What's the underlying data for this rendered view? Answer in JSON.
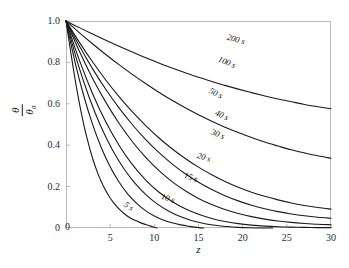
{
  "chart_data": {
    "type": "line",
    "title": "",
    "xlabel": "z",
    "ylabel": "theta/theta_0",
    "xlim": [
      0,
      30
    ],
    "ylim": [
      0,
      1.0
    ],
    "grid": false,
    "legend_position": "inline-curve-labels",
    "xticks": [
      0,
      5,
      10,
      15,
      20,
      25,
      30
    ],
    "xticklabels": [
      "0",
      "5",
      "10",
      "15",
      "20",
      "25",
      "30"
    ],
    "yticks": [
      0,
      0.2,
      0.4,
      0.6,
      0.8,
      1.0
    ],
    "yticklabels": [
      "0",
      "0.2",
      "0.4",
      "0.6",
      "0.8",
      "1.0"
    ],
    "series": [
      {
        "name": "5 s",
        "label": "5 s",
        "label_x": 7.1,
        "label_y": 0.105,
        "x": [
          0,
          0.6,
          1.2,
          1.8,
          2.4,
          3.0,
          3.6,
          4.2,
          4.8,
          5.4,
          6.0,
          6.6,
          7.2,
          7.8,
          8.4,
          9.0,
          9.6,
          10.3
        ],
        "y": [
          1.0,
          0.832,
          0.676,
          0.542,
          0.43,
          0.338,
          0.264,
          0.205,
          0.158,
          0.121,
          0.092,
          0.069,
          0.051,
          0.037,
          0.026,
          0.017,
          0.009,
          0.0
        ]
      },
      {
        "name": "10 s",
        "label": "10 s",
        "label_x": 11.6,
        "label_y": 0.145,
        "x": [
          0,
          1,
          2,
          3,
          4,
          5,
          6,
          7,
          8,
          9,
          10,
          11,
          12,
          13,
          14,
          15,
          15.6
        ],
        "y": [
          1.0,
          0.805,
          0.64,
          0.502,
          0.388,
          0.296,
          0.222,
          0.164,
          0.119,
          0.084,
          0.058,
          0.039,
          0.025,
          0.015,
          0.008,
          0.002,
          0.0
        ]
      },
      {
        "name": "15 s",
        "label": "15 s",
        "label_x": 14.2,
        "label_y": 0.245,
        "x": [
          0,
          1.3,
          2.6,
          3.9,
          5.2,
          6.5,
          7.8,
          9.1,
          10.4,
          11.7,
          13.0,
          14.3,
          15.6,
          16.9,
          18.2,
          19.5,
          20.8,
          22.1,
          23.4
        ],
        "y": [
          1.0,
          0.8,
          0.634,
          0.495,
          0.382,
          0.29,
          0.217,
          0.159,
          0.114,
          0.08,
          0.054,
          0.035,
          0.022,
          0.013,
          0.007,
          0.003,
          0.001,
          0.0,
          0.0
        ]
      },
      {
        "name": "20 s",
        "label": "20 s",
        "label_x": 15.6,
        "label_y": 0.345,
        "x": [
          0,
          1.5,
          3,
          4.5,
          6,
          7.5,
          9,
          10.5,
          12,
          13.5,
          15,
          16.5,
          18,
          19.5,
          21,
          22.5,
          24,
          25.5,
          27,
          28.5,
          30
        ],
        "y": [
          1.0,
          0.812,
          0.65,
          0.513,
          0.4,
          0.307,
          0.233,
          0.174,
          0.128,
          0.093,
          0.066,
          0.046,
          0.031,
          0.021,
          0.014,
          0.009,
          0.006,
          0.004,
          0.003,
          0.002,
          0.002
        ]
      },
      {
        "name": "30 s",
        "label": "30 s",
        "label_x": 17.2,
        "label_y": 0.455,
        "x": [
          0,
          1.5,
          3,
          4.5,
          6,
          7.5,
          9,
          10.5,
          12,
          13.5,
          15,
          16.5,
          18,
          19.5,
          21,
          22.5,
          24,
          25.5,
          27,
          28.5,
          30
        ],
        "y": [
          1.0,
          0.855,
          0.724,
          0.608,
          0.506,
          0.418,
          0.342,
          0.278,
          0.224,
          0.18,
          0.143,
          0.113,
          0.089,
          0.07,
          0.055,
          0.043,
          0.034,
          0.027,
          0.022,
          0.018,
          0.016
        ]
      },
      {
        "name": "40 s",
        "label": "40 s",
        "label_x": 17.7,
        "label_y": 0.545,
        "x": [
          0,
          1.5,
          3,
          4.5,
          6,
          7.5,
          9,
          10.5,
          12,
          13.5,
          15,
          16.5,
          18,
          19.5,
          21,
          22.5,
          24,
          25.5,
          27,
          28.5,
          30
        ],
        "y": [
          1.0,
          0.88,
          0.77,
          0.67,
          0.58,
          0.5,
          0.428,
          0.365,
          0.31,
          0.262,
          0.221,
          0.186,
          0.156,
          0.131,
          0.11,
          0.093,
          0.079,
          0.068,
          0.059,
          0.052,
          0.047
        ]
      },
      {
        "name": "50 s",
        "label": "50 s",
        "label_x": 17.0,
        "label_y": 0.65,
        "x": [
          0,
          1.5,
          3,
          4.5,
          6,
          7.5,
          9,
          10.5,
          12,
          13.5,
          15,
          16.5,
          18,
          19.5,
          21,
          22.5,
          24,
          25.5,
          27,
          28.5,
          30
        ],
        "y": [
          1.0,
          0.898,
          0.803,
          0.715,
          0.635,
          0.562,
          0.496,
          0.436,
          0.383,
          0.336,
          0.294,
          0.257,
          0.225,
          0.197,
          0.173,
          0.153,
          0.136,
          0.121,
          0.109,
          0.099,
          0.091
        ]
      },
      {
        "name": "100 s",
        "label": "100 s",
        "label_x": 18.2,
        "label_y": 0.8,
        "x": [
          0,
          1.5,
          3,
          4.5,
          6,
          7.5,
          9,
          10.5,
          12,
          13.5,
          15,
          16.5,
          18,
          19.5,
          21,
          22.5,
          24,
          25.5,
          27,
          28.5,
          30
        ],
        "y": [
          1.0,
          0.944,
          0.89,
          0.838,
          0.789,
          0.742,
          0.698,
          0.656,
          0.617,
          0.581,
          0.547,
          0.516,
          0.487,
          0.461,
          0.437,
          0.415,
          0.396,
          0.378,
          0.363,
          0.349,
          0.337
        ]
      },
      {
        "name": "200 s",
        "label": "200 s",
        "label_x": 19.3,
        "label_y": 0.915,
        "x": [
          0,
          1.5,
          3,
          4.5,
          6,
          7.5,
          9,
          10.5,
          12,
          13.5,
          15,
          16.5,
          18,
          19.5,
          21,
          22.5,
          24,
          25.5,
          27,
          28.5,
          30
        ],
        "y": [
          1.0,
          0.968,
          0.937,
          0.907,
          0.878,
          0.85,
          0.823,
          0.797,
          0.773,
          0.75,
          0.728,
          0.708,
          0.689,
          0.671,
          0.654,
          0.638,
          0.623,
          0.61,
          0.597,
          0.586,
          0.576
        ]
      }
    ],
    "axis_color": "#b9b9b9",
    "curve_color": "#1a1a1a",
    "background": "#ffffff"
  },
  "ylabel_parts": {
    "numerator": "θ",
    "denominator": "θ",
    "denominator_sub": "0"
  }
}
